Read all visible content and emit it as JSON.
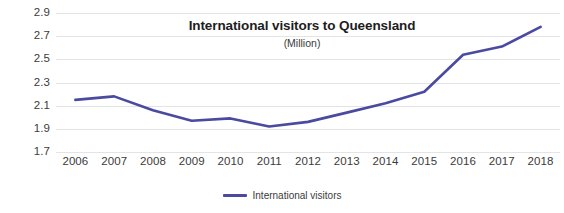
{
  "chart_data": {
    "type": "line",
    "title": "International visitors to Queensland",
    "subtitle": "(Million)",
    "xlabel": "",
    "ylabel": "",
    "categories": [
      "2006",
      "2007",
      "2008",
      "2009",
      "2010",
      "2011",
      "2012",
      "2013",
      "2014",
      "2015",
      "2016",
      "2017",
      "2018"
    ],
    "series": [
      {
        "name": "International visitors",
        "color": "#4a4aa0",
        "values": [
          2.15,
          2.18,
          2.06,
          1.97,
          1.99,
          1.92,
          1.96,
          2.04,
          2.12,
          2.22,
          2.54,
          2.61,
          2.78
        ]
      }
    ],
    "ylim": [
      1.7,
      2.9
    ],
    "yticks": [
      "1.7",
      "1.9",
      "2.1",
      "2.3",
      "2.5",
      "2.7",
      "2.9"
    ],
    "ytick_values": [
      1.7,
      1.9,
      2.1,
      2.3,
      2.5,
      2.7,
      2.9
    ],
    "grid": true,
    "grid_color": "#e4e4e6",
    "legend_position": "bottom",
    "legend": [
      "International visitors"
    ],
    "background": "#ffffff"
  }
}
